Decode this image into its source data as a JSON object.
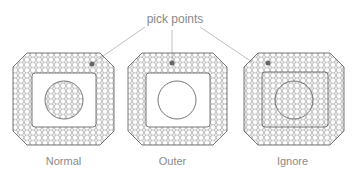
{
  "diagram": {
    "callout_label": "pick points",
    "panels": [
      {
        "label": "Normal",
        "mode": "normal"
      },
      {
        "label": "Outer",
        "mode": "outer"
      },
      {
        "label": "Ignore",
        "mode": "ignore"
      }
    ],
    "colors": {
      "stroke": "#555555",
      "callout": "#b0b0b0",
      "text": "#8a8a8a",
      "point": "#666666"
    }
  }
}
